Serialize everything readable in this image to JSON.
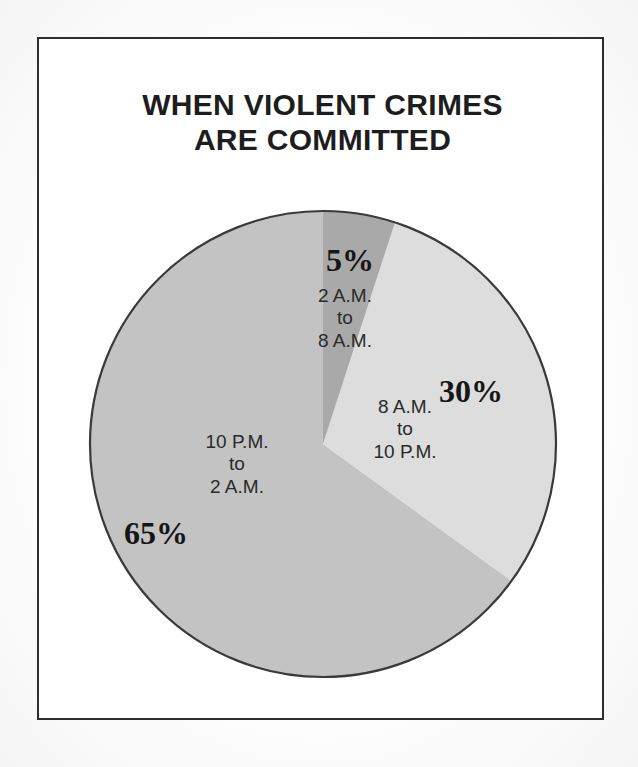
{
  "figure": {
    "title_line1": "WHEN VIOLENT CRIMES",
    "title_line2": "ARE COMMITTED",
    "background_color": "#ffffff",
    "frame_color": "#2e2e2e",
    "text_color": "#2a2a2a"
  },
  "chart_data": {
    "type": "pie",
    "title": "WHEN VIOLENT CRIMES ARE COMMITTED",
    "xlabel": "",
    "ylabel": "",
    "legend_position": "none",
    "grid": false,
    "start_angle_deg": 0,
    "direction": "clockwise",
    "units": "percent",
    "categories": [
      "2 A.M. to 8 A.M.",
      "8 A.M. to 10 P.M.",
      "10 P.M. to 2 A.M."
    ],
    "values": [
      5,
      30,
      65
    ],
    "labels": [
      "5%",
      "30%",
      "65%"
    ],
    "colors": [
      "#a9a9a9",
      "#dddddd",
      "#c3c3c3"
    ],
    "slices": [
      {
        "percent_label": "5%",
        "value": 5,
        "range_line1": "2 A.M.",
        "range_connector": "to",
        "range_line2": "8 A.M.",
        "color": "#a9a9a9",
        "start_deg": 0,
        "end_deg": 18
      },
      {
        "percent_label": "30%",
        "value": 30,
        "range_line1": "8 A.M.",
        "range_connector": "to",
        "range_line2": "10 P.M.",
        "color": "#dddddd",
        "start_deg": 18,
        "end_deg": 126
      },
      {
        "percent_label": "65%",
        "value": 65,
        "range_line1": "10 P.M.",
        "range_connector": "to",
        "range_line2": "2 A.M.",
        "color": "#c3c3c3",
        "start_deg": 126,
        "end_deg": 360
      }
    ]
  }
}
